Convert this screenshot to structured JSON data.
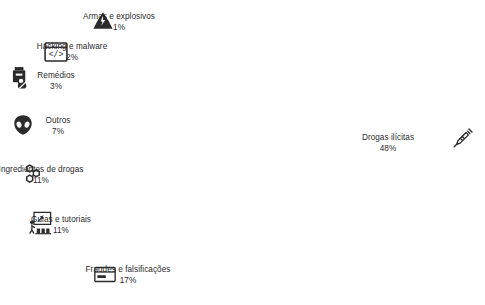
{
  "chart_data": {
    "type": "pie",
    "variant": "donut",
    "title": "",
    "subtitle": "",
    "xlabel": "",
    "ylabel": "",
    "legend_position": "callout-labels",
    "grid": false,
    "units": "percent",
    "total": 100,
    "start_angle_deg": 0,
    "direction": "clockwise",
    "categories": [
      "Drogas ilícitas",
      "Fraudes e falsificações",
      "Guias e tutoriais",
      "Ingredientes de drogas",
      "Outros",
      "Remédios",
      "Hacking e malware",
      "Armas e explosivos"
    ],
    "values": [
      48,
      17,
      11,
      11,
      7,
      3,
      2,
      1
    ],
    "labels_with_pct": [
      "Drogas ilícitas 48%",
      "Fraudes e falsificações 17%",
      "Guias e tutoriais 11%",
      "Ingredientes de drogas 11%",
      "Outros 7%",
      "Remédios 3%",
      "Hacking e malware 2%",
      "Armas e explosivos 1%"
    ],
    "colors": [
      "#3d3d3f",
      "#4f4f52",
      "#636366",
      "#77777a",
      "#8a8a8d",
      "#a0a0a3",
      "#b6b6b9",
      "#cfcfd1"
    ]
  },
  "style": {
    "background": "#ffffff",
    "text_color": "#2b2b2b",
    "separator_color": "#ffffff",
    "center_x": 245,
    "center_y": 152,
    "outer_radius": 93,
    "inner_radius": 62,
    "gap_deg": 1.1
  },
  "slices": [
    {
      "id": "drogas-ilicitas",
      "name": "Drogas ilícitas",
      "value": 48,
      "pct": "48%",
      "color": "#3d3d3f",
      "icon": "syringe-icon",
      "label_x": 388,
      "label_y": 133,
      "icon_x": 452,
      "icon_y": 127
    },
    {
      "id": "fraudes-e-falsificacoes",
      "name": "Fraudes e falsificações",
      "value": 17,
      "pct": "17%",
      "color": "#4f4f52",
      "icon": "credit-card-icon",
      "label_x": 128,
      "label_y": 265,
      "icon_x": 94,
      "icon_y": 266
    },
    {
      "id": "guias-e-tutoriais",
      "name": "Guias e tutoriais",
      "value": 11,
      "pct": "11%",
      "color": "#636366",
      "icon": "presentation-teacher-icon",
      "label_x": 61,
      "label_y": 215,
      "icon_x": 28,
      "icon_y": 211
    },
    {
      "id": "ingredientes-de-drogas",
      "name": "Ingredientes de drogas",
      "value": 11,
      "pct": "11%",
      "color": "#77777a",
      "icon": "molecule-icon",
      "label_x": 41,
      "label_y": 165,
      "icon_x": 22,
      "icon_y": 163
    },
    {
      "id": "outros",
      "name": "Outros",
      "value": 7,
      "pct": "7%",
      "color": "#8a8a8d",
      "icon": "alien-icon",
      "label_x": 58,
      "label_y": 116,
      "icon_x": 13,
      "icon_y": 114
    },
    {
      "id": "remedios",
      "name": "Remédios",
      "value": 3,
      "pct": "3%",
      "color": "#a0a0a3",
      "icon": "medicine-bottle-icon",
      "label_x": 56,
      "label_y": 71,
      "icon_x": 10,
      "icon_y": 66
    },
    {
      "id": "hacking-e-malware",
      "name": "Hacking e malware",
      "value": 2,
      "pct": "2%",
      "color": "#b6b6b9",
      "icon": "code-window-icon",
      "label_x": 72,
      "label_y": 42,
      "icon_x": 44,
      "icon_y": 42
    },
    {
      "id": "armas-e-explosivos",
      "name": "Armas e explosivos",
      "value": 1,
      "pct": "1%",
      "color": "#cfcfd1",
      "icon": "bomb-explosion-icon",
      "label_x": 119,
      "label_y": 12,
      "icon_x": 92,
      "icon_y": 11
    }
  ]
}
